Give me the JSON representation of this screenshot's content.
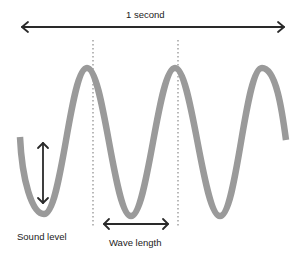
{
  "diagram": {
    "title_label": "1 second",
    "amplitude_label": "Sound level",
    "wavelength_label": "Wave length",
    "colors": {
      "wave": "#9a9a9a",
      "arrow": "#2a2a2a",
      "dotted_guide": "#8a8a8a",
      "background": "#ffffff"
    },
    "wave": {
      "start": [
        20,
        137
      ],
      "troughs": [
        [
          44,
          214
        ],
        [
          131,
          216
        ],
        [
          220,
          216
        ]
      ],
      "peaks": [
        [
          87,
          68
        ],
        [
          175,
          68
        ],
        [
          262,
          68
        ]
      ],
      "end": [
        286,
        140
      ]
    }
  }
}
